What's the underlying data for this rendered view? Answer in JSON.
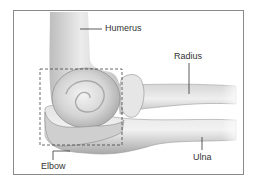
{
  "figure": {
    "labels": {
      "humerus": "Humerus",
      "radius": "Radius",
      "ulna": "Ulna",
      "elbow": "Elbow"
    }
  }
}
